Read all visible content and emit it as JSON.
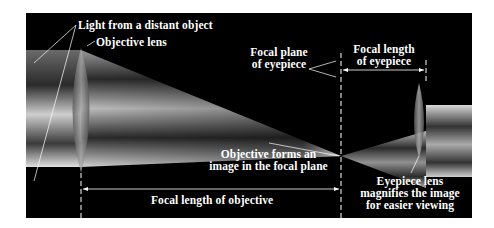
{
  "diagram": {
    "labels": {
      "light": "Light from a distant object",
      "objective_lens": "Objective lens",
      "focal_plane_line1": "Focal plane",
      "focal_plane_line2": "of eyepiece",
      "focal_length_eyepiece_line1": "Focal length",
      "focal_length_eyepiece_line2": "of eyepiece",
      "image_line1": "Objective forms an",
      "image_line2": "image in the focal plane",
      "eyepiece_line1": "Eyepiece lens",
      "eyepiece_line2": "magnifies the image",
      "eyepiece_line3": "for easier viewing",
      "focal_length_objective": "Focal length of objective"
    },
    "colors": {
      "background": "#000000",
      "text": "#ffffff",
      "beam": "#bfbfbf"
    }
  }
}
